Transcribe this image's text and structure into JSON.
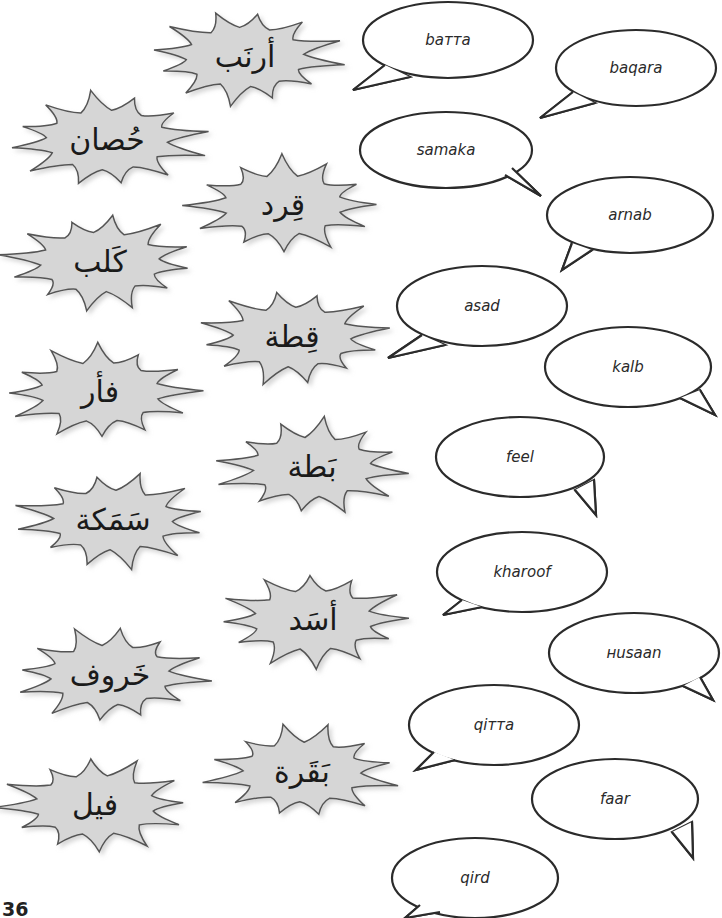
{
  "page": {
    "number": "36",
    "colors": {
      "burst_fill": "#d6d6d6",
      "burst_stroke": "#555555",
      "bubble_stroke": "#2b2b2b",
      "background": "#ffffff"
    }
  },
  "arabic_words": [
    {
      "text": "أرنَب",
      "cx": 245,
      "cy": 57,
      "w": 190,
      "h": 96
    },
    {
      "text": "حُصان",
      "cx": 107,
      "cy": 140,
      "w": 196,
      "h": 96
    },
    {
      "text": "قِرد",
      "cx": 283,
      "cy": 205,
      "w": 190,
      "h": 96
    },
    {
      "text": "كَلب",
      "cx": 100,
      "cy": 262,
      "w": 192,
      "h": 96
    },
    {
      "text": "قِطة",
      "cx": 292,
      "cy": 337,
      "w": 190,
      "h": 96
    },
    {
      "text": "فأر",
      "cx": 100,
      "cy": 392,
      "w": 192,
      "h": 96
    },
    {
      "text": "بَطة",
      "cx": 312,
      "cy": 467,
      "w": 190,
      "h": 96
    },
    {
      "text": "سَمَكة",
      "cx": 113,
      "cy": 520,
      "w": 192,
      "h": 96
    },
    {
      "text": "أسَد",
      "cx": 313,
      "cy": 620,
      "w": 190,
      "h": 96
    },
    {
      "text": "خَروف",
      "cx": 110,
      "cy": 675,
      "w": 192,
      "h": 96
    },
    {
      "text": "بَقَرة",
      "cx": 302,
      "cy": 772,
      "w": 190,
      "h": 96
    },
    {
      "text": "فيل",
      "cx": 95,
      "cy": 805,
      "w": 192,
      "h": 96
    }
  ],
  "transliterations": [
    {
      "text": "baттa",
      "cx": 448,
      "cy": 40,
      "rx": 85,
      "ry": 38,
      "tail": [
        [
          385,
          65
        ],
        [
          353,
          90
        ],
        [
          410,
          77
        ]
      ]
    },
    {
      "text": "baqara",
      "cx": 636,
      "cy": 68,
      "rx": 80,
      "ry": 38,
      "tail": [
        [
          573,
          92
        ],
        [
          540,
          118
        ],
        [
          595,
          103
        ]
      ]
    },
    {
      "text": "samaka",
      "cx": 446,
      "cy": 150,
      "rx": 86,
      "ry": 38,
      "tail": [
        [
          505,
          175
        ],
        [
          541,
          196
        ],
        [
          512,
          168
        ]
      ]
    },
    {
      "text": "arnab",
      "cx": 630,
      "cy": 215,
      "rx": 83,
      "ry": 38,
      "tail": [
        [
          572,
          243
        ],
        [
          562,
          270
        ],
        [
          592,
          250
        ]
      ]
    },
    {
      "text": "asad",
      "cx": 482,
      "cy": 306,
      "rx": 85,
      "ry": 40,
      "tail": [
        [
          422,
          335
        ],
        [
          388,
          358
        ],
        [
          445,
          345
        ]
      ]
    },
    {
      "text": "kalb",
      "cx": 628,
      "cy": 367,
      "rx": 83,
      "ry": 40,
      "tail": [
        [
          680,
          398
        ],
        [
          715,
          415
        ],
        [
          700,
          390
        ]
      ]
    },
    {
      "text": "feel",
      "cx": 520,
      "cy": 457,
      "rx": 84,
      "ry": 40,
      "tail": [
        [
          575,
          490
        ],
        [
          596,
          515
        ],
        [
          594,
          480
        ]
      ]
    },
    {
      "text": "kharoof",
      "cx": 522,
      "cy": 572,
      "rx": 85,
      "ry": 40,
      "tail": [
        [
          462,
          600
        ],
        [
          443,
          615
        ],
        [
          482,
          607
        ]
      ]
    },
    {
      "text": "нusaan",
      "cx": 634,
      "cy": 653,
      "rx": 85,
      "ry": 40,
      "tail": [
        [
          683,
          686
        ],
        [
          713,
          700
        ],
        [
          700,
          677
        ]
      ]
    },
    {
      "text": "qiттa",
      "cx": 494,
      "cy": 725,
      "rx": 85,
      "ry": 40,
      "tail": [
        [
          434,
          752
        ],
        [
          416,
          770
        ],
        [
          455,
          760
        ]
      ]
    },
    {
      "text": "faar",
      "cx": 615,
      "cy": 799,
      "rx": 83,
      "ry": 40,
      "tail": [
        [
          672,
          832
        ],
        [
          693,
          858
        ],
        [
          692,
          822
        ]
      ]
    },
    {
      "text": "qird",
      "cx": 475,
      "cy": 878,
      "rx": 83,
      "ry": 40,
      "tail": [
        [
          420,
          905
        ],
        [
          405,
          918
        ],
        [
          440,
          912
        ]
      ]
    }
  ]
}
